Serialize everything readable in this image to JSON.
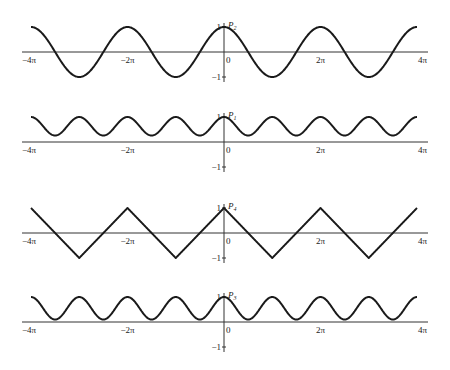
{
  "chart_data": [
    {
      "type": "line",
      "title": "P2",
      "label": "P",
      "subscript": "2",
      "description": "cosine wave, period 2π, amplitude 1",
      "x_range": [
        -12.566,
        12.566
      ],
      "ylim": [
        -1,
        1
      ],
      "xticks": [
        "-4π",
        "-2π",
        "0",
        "2π",
        "4π"
      ],
      "yticks": [
        "1",
        "-1"
      ],
      "function": "cos",
      "params": {
        "offset": 0,
        "amplitude": 1,
        "period_pi": 2
      }
    },
    {
      "type": "line",
      "title": "P1",
      "label": "P",
      "subscript": "1",
      "description": "positive wave, period π, oscillating between ~0.3 and 1",
      "x_range": [
        -12.566,
        12.566
      ],
      "ylim": [
        -1,
        1
      ],
      "xticks": [
        "-4π",
        "-2π",
        "0",
        "2π",
        "4π"
      ],
      "yticks": [
        "1",
        "-1"
      ],
      "function": "cos",
      "params": {
        "offset": 0.63,
        "amplitude": 0.37,
        "period_pi": 1
      }
    },
    {
      "type": "line",
      "title": "P4",
      "label": "P",
      "subscript": "4",
      "description": "triangle-like wave, period 2π, amplitude 1",
      "x_range": [
        -12.566,
        12.566
      ],
      "ylim": [
        -1,
        1
      ],
      "xticks": [
        "-4π",
        "-2π",
        "0",
        "2π",
        "4π"
      ],
      "yticks": [
        "1",
        "-1"
      ],
      "function": "triangle",
      "params": {
        "offset": 0,
        "amplitude": 1,
        "period_pi": 2
      }
    },
    {
      "type": "line",
      "title": "P3",
      "label": "P",
      "subscript": "3",
      "description": "positive wave, period π, oscillating between ~0.1 and 1",
      "x_range": [
        -12.566,
        12.566
      ],
      "ylim": [
        -1,
        1
      ],
      "xticks": [
        "-4π",
        "-2π",
        "0",
        "2π",
        "4π"
      ],
      "yticks": [
        "1",
        "-1"
      ],
      "function": "cos",
      "params": {
        "offset": 0.55,
        "amplitude": 0.45,
        "period_pi": 1
      }
    }
  ],
  "layout": {
    "x_axis_left": 22,
    "x_axis_right": 428,
    "y_axis_x": 224,
    "x_min_px": 31,
    "x_max_px": 417,
    "panels": [
      {
        "axis_y": 52,
        "unit_px": 25
      },
      {
        "axis_y": 142,
        "unit_px": 25
      },
      {
        "axis_y": 233,
        "unit_px": 25
      },
      {
        "axis_y": 322,
        "unit_px": 25
      }
    ],
    "line_color": "#1a1a1a",
    "axis_color": "#333333"
  }
}
